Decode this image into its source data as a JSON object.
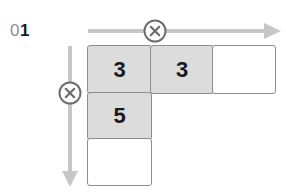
{
  "canvas": {
    "width": 286,
    "height": 193,
    "background": "#ffffff"
  },
  "step": {
    "label": "01",
    "dim_part": "0",
    "strong_part": "1",
    "dim_color": "#8e8e8e",
    "strong_color": "#1b1b1b"
  },
  "axes": {
    "horizontal": {
      "name": "horizontal-axis-arrow",
      "direction": "right",
      "color": "#c7c7c7",
      "marker": {
        "icon": "circle-x-icon",
        "color": "#6e6e6e"
      }
    },
    "vertical": {
      "name": "vertical-axis-arrow",
      "direction": "down",
      "color": "#c7c7c7",
      "marker": {
        "icon": "circle-x-icon",
        "color": "#6e6e6e"
      }
    }
  },
  "grid": {
    "columns": 3,
    "rows": 3,
    "filled_color": "#dcdcdc",
    "empty_color": "#ffffff",
    "border_color": "#8d8d8d",
    "cells": [
      [
        {
          "state": "filled",
          "value": "3"
        },
        {
          "state": "filled",
          "value": "3"
        },
        {
          "state": "empty",
          "value": ""
        }
      ],
      [
        {
          "state": "filled",
          "value": "5"
        },
        {
          "state": "blank",
          "value": ""
        },
        {
          "state": "blank",
          "value": ""
        }
      ],
      [
        {
          "state": "empty",
          "value": ""
        },
        {
          "state": "blank",
          "value": ""
        },
        {
          "state": "blank",
          "value": ""
        }
      ]
    ]
  }
}
